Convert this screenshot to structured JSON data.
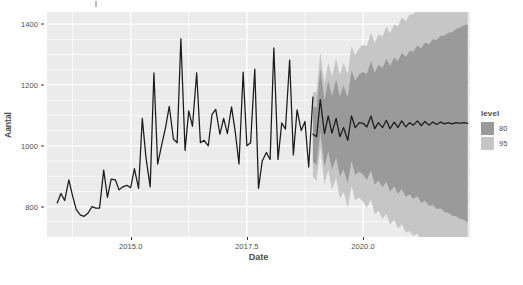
{
  "chart_data": {
    "type": "line",
    "title": "",
    "xlabel": "Date",
    "ylabel": "Aantal",
    "xlim": [
      2013.2,
      2022.3
    ],
    "ylim": [
      700,
      1440
    ],
    "grid": true,
    "legend_position": "right",
    "legend_title": "level",
    "y_ticks": [
      800,
      1000,
      1200,
      1400
    ],
    "y_tick_labels": [
      "800",
      "1000",
      "1200",
      "1400"
    ],
    "x_ticks": [
      2015.0,
      2017.5,
      2020.0
    ],
    "x_tick_labels": [
      "2015.0",
      "2017.5",
      "2020.0"
    ],
    "colors": {
      "panel_background": "#ebebeb",
      "gridline": "#ffffff",
      "line": "#1a1a1a",
      "interval_80": "#9a9a9a",
      "interval_95": "#c6c6c6",
      "text": "#4d4d4d"
    },
    "legend_entries": [
      {
        "label": "80",
        "color": "#9a9a9a"
      },
      {
        "label": "95",
        "color": "#c6c6c6"
      }
    ],
    "forecast_start_x": 2018.92,
    "series": [
      {
        "name": "Aantal",
        "kind": "observed-line",
        "x": [
          2013.42,
          2013.5,
          2013.58,
          2013.67,
          2013.75,
          2013.83,
          2013.92,
          2014.0,
          2014.08,
          2014.17,
          2014.25,
          2014.33,
          2014.42,
          2014.5,
          2014.58,
          2014.67,
          2014.75,
          2014.83,
          2014.92,
          2015.0,
          2015.08,
          2015.17,
          2015.25,
          2015.33,
          2015.42,
          2015.5,
          2015.58,
          2015.67,
          2015.75,
          2015.83,
          2015.92,
          2016.0,
          2016.08,
          2016.17,
          2016.25,
          2016.33,
          2016.42,
          2016.5,
          2016.58,
          2016.67,
          2016.75,
          2016.83,
          2016.92,
          2017.0,
          2017.08,
          2017.17,
          2017.25,
          2017.33,
          2017.42,
          2017.5,
          2017.58,
          2017.67,
          2017.75,
          2017.83,
          2017.92,
          2018.0,
          2018.08,
          2018.17,
          2018.25,
          2018.33,
          2018.42,
          2018.5,
          2018.58,
          2018.67,
          2018.75,
          2018.83,
          2018.92
        ],
        "y": [
          812,
          843,
          820,
          888,
          835,
          790,
          772,
          768,
          778,
          800,
          795,
          795,
          920,
          830,
          890,
          888,
          855,
          865,
          870,
          862,
          925,
          860,
          1090,
          960,
          865,
          1240,
          940,
          1005,
          1060,
          1130,
          1022,
          1010,
          1352,
          985,
          1115,
          1064,
          1240,
          1010,
          1018,
          1000,
          1103,
          1120,
          1038,
          1090,
          1040,
          1128,
          1046,
          940,
          1242,
          1000,
          1010,
          1252,
          860,
          950,
          978,
          955,
          1322,
          955,
          1075,
          1055,
          1282,
          970,
          1118,
          1050,
          1080,
          930,
          1160
        ]
      },
      {
        "name": "Forecast",
        "kind": "forecast-line",
        "x": [
          2018.92,
          2019.0,
          2019.08,
          2019.17,
          2019.25,
          2019.33,
          2019.42,
          2019.5,
          2019.58,
          2019.67,
          2019.75,
          2019.83,
          2019.92,
          2020.0,
          2020.08,
          2020.17,
          2020.25,
          2020.33,
          2020.42,
          2020.5,
          2020.58,
          2020.67,
          2020.75,
          2020.83,
          2020.92,
          2021.0,
          2021.08,
          2021.17,
          2021.25,
          2021.33,
          2021.42,
          2021.5,
          2021.58,
          2021.67,
          2021.75,
          2021.83,
          2021.92,
          2022.0,
          2022.08,
          2022.17,
          2022.25
        ],
        "y": [
          1038,
          1030,
          1152,
          1040,
          1098,
          1042,
          1090,
          1030,
          1060,
          1018,
          1098,
          1060,
          1076,
          1074,
          1062,
          1098,
          1056,
          1076,
          1060,
          1084,
          1056,
          1078,
          1060,
          1082,
          1062,
          1076,
          1068,
          1082,
          1066,
          1080,
          1068,
          1078,
          1070,
          1078,
          1072,
          1076,
          1072,
          1076,
          1074,
          1076,
          1074
        ]
      },
      {
        "name": "80% prediction interval",
        "kind": "ribbon",
        "level": 80,
        "color": "#9a9a9a",
        "x": [
          2018.92,
          2019.0,
          2019.08,
          2019.17,
          2019.25,
          2019.33,
          2019.42,
          2019.5,
          2019.58,
          2019.67,
          2019.75,
          2019.83,
          2019.92,
          2020.0,
          2020.08,
          2020.17,
          2020.25,
          2020.33,
          2020.42,
          2020.5,
          2020.58,
          2020.67,
          2020.75,
          2020.83,
          2020.92,
          2021.0,
          2021.08,
          2021.17,
          2021.25,
          2021.33,
          2021.42,
          2021.5,
          2021.58,
          2021.67,
          2021.75,
          2021.83,
          2021.92,
          2022.0,
          2022.08,
          2022.17,
          2022.25
        ],
        "lower": [
          948,
          935,
          1048,
          930,
          982,
          920,
          962,
          898,
          922,
          876,
          948,
          905,
          915,
          905,
          888,
          918,
          872,
          886,
          864,
          882,
          850,
          866,
          842,
          858,
          832,
          840,
          826,
          834,
          812,
          820,
          802,
          806,
          792,
          794,
          782,
          780,
          770,
          768,
          760,
          756,
          748
        ],
        "upper": [
          1128,
          1125,
          1256,
          1150,
          1214,
          1164,
          1218,
          1162,
          1198,
          1160,
          1248,
          1215,
          1236,
          1243,
          1236,
          1278,
          1240,
          1266,
          1256,
          1286,
          1262,
          1290,
          1278,
          1306,
          1292,
          1312,
          1310,
          1330,
          1320,
          1340,
          1334,
          1350,
          1348,
          1362,
          1362,
          1372,
          1374,
          1384,
          1388,
          1396,
          1400
        ]
      },
      {
        "name": "95% prediction interval",
        "kind": "ribbon",
        "level": 95,
        "color": "#c6c6c6",
        "x": [
          2018.92,
          2019.0,
          2019.08,
          2019.17,
          2019.25,
          2019.33,
          2019.42,
          2019.5,
          2019.58,
          2019.67,
          2019.75,
          2019.83,
          2019.92,
          2020.0,
          2020.08,
          2020.17,
          2020.25,
          2020.33,
          2020.42,
          2020.5,
          2020.58,
          2020.67,
          2020.75,
          2020.83,
          2020.92,
          2021.0,
          2021.08,
          2021.17,
          2021.25,
          2021.33,
          2021.42,
          2021.5,
          2021.58,
          2021.67,
          2021.75,
          2021.83,
          2021.92,
          2022.0,
          2022.08,
          2022.17,
          2022.25
        ],
        "lower": [
          900,
          884,
          996,
          872,
          920,
          856,
          894,
          826,
          848,
          798,
          868,
          822,
          830,
          816,
          796,
          824,
          774,
          786,
          760,
          776,
          742,
          756,
          728,
          742,
          714,
          720,
          704,
          710,
          686,
          692,
          672,
          674,
          658,
          658,
          644,
          640,
          628,
          624,
          614,
          608,
          598
        ],
        "upper": [
          1176,
          1178,
          1308,
          1206,
          1274,
          1228,
          1286,
          1234,
          1272,
          1238,
          1328,
          1298,
          1322,
          1332,
          1328,
          1372,
          1338,
          1366,
          1360,
          1392,
          1370,
          1400,
          1392,
          1422,
          1410,
          1432,
          1432,
          1454,
          1446,
          1468,
          1464,
          1482,
          1482,
          1498,
          1500,
          1512,
          1516,
          1528,
          1534,
          1544,
          1550
        ]
      }
    ]
  },
  "axes": {
    "y_title": "Aantal",
    "x_title": "Date"
  },
  "legend": {
    "title": "level",
    "items": [
      {
        "label": "80"
      },
      {
        "label": "95"
      }
    ]
  }
}
